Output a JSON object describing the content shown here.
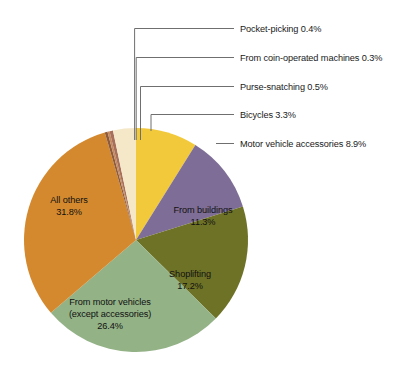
{
  "chart_data": {
    "type": "pie",
    "title": "",
    "subtitle": "",
    "xlabel": "",
    "ylabel": "",
    "legend_position": "callout-labels",
    "grid": false,
    "units": "percent",
    "start_angle_deg": 0,
    "direction": "clockwise",
    "categories": [
      "Motor vehicle accessories",
      "From buildings",
      "Shoplifting",
      "From motor vehicles (except accessories)",
      "All others",
      "Pocket-picking",
      "From coin-operated machines",
      "Purse-snatching",
      "Bicycles"
    ],
    "values": [
      8.9,
      11.3,
      17.2,
      26.4,
      31.8,
      0.4,
      0.3,
      0.5,
      3.3
    ],
    "colors": [
      "#F2C93A",
      "#7E6D96",
      "#6E7226",
      "#93B286",
      "#D4892E",
      "#8E5A3C",
      "#C48A5E",
      "#A8705A",
      "#F5E8C8"
    ]
  },
  "slices": [
    {
      "key": "motor-vehicle-accessories",
      "label": "Motor vehicle accessories",
      "percent": "8.9%",
      "value": 8.9,
      "color": "#F2C93A",
      "label_style": "callout"
    },
    {
      "key": "from-buildings",
      "label": "From buildings",
      "percent": "11.3%",
      "value": 11.3,
      "color": "#7E6D96",
      "label_style": "inside"
    },
    {
      "key": "shoplifting",
      "label": "Shoplifting",
      "percent": "17.2%",
      "value": 17.2,
      "color": "#6E7226",
      "label_style": "inside"
    },
    {
      "key": "from-motor-vehicles",
      "label": "From motor vehicles",
      "label_line2": "(except accessories)",
      "percent": "26.4%",
      "value": 26.4,
      "color": "#93B286",
      "label_style": "inside"
    },
    {
      "key": "all-others",
      "label": "All others",
      "percent": "31.8%",
      "value": 31.8,
      "color": "#D4892E",
      "label_style": "inside"
    },
    {
      "key": "pocket-picking",
      "label": "Pocket-picking",
      "percent": "0.4%",
      "value": 0.4,
      "color": "#8E5A3C",
      "label_style": "callout"
    },
    {
      "key": "from-coin-operated-machines",
      "label": "From coin-operated machines",
      "percent": "0.3%",
      "value": 0.3,
      "color": "#C48A5E",
      "label_style": "callout"
    },
    {
      "key": "purse-snatching",
      "label": "Purse-snatching",
      "percent": "0.5%",
      "value": 0.5,
      "color": "#A8705A",
      "label_style": "callout"
    },
    {
      "key": "bicycles",
      "label": "Bicycles",
      "percent": "3.3%",
      "value": 3.3,
      "color": "#F5E8C8",
      "label_style": "callout"
    }
  ],
  "callouts": {
    "pocket_picking": "Pocket-picking 0.4%",
    "coin_operated": "From coin-operated machines 0.3%",
    "purse_snatching": "Purse-snatching 0.5%",
    "bicycles": "Bicycles 3.3%",
    "motor_vehicle_accessories": "Motor vehicle accessories 8.9%"
  },
  "inside_labels": {
    "all_others_name": "All others",
    "all_others_pct": "31.8%",
    "from_motor_vehicles_l1": "From motor vehicles",
    "from_motor_vehicles_l2": "(except accessories)",
    "from_motor_vehicles_pct": "26.4%",
    "shoplifting_name": "Shoplifting",
    "shoplifting_pct": "17.2%",
    "from_buildings_name": "From buildings",
    "from_buildings_pct": "11.3%"
  },
  "geometry": {
    "center_x": 136,
    "center_y": 240,
    "radius": 112
  }
}
